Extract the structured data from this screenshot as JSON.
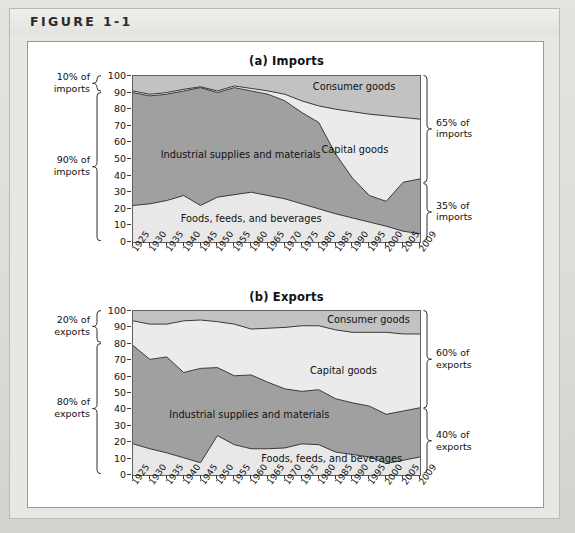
{
  "figure": {
    "label": "FIGURE 1-1"
  },
  "colors": {
    "foods": "#e8e8e8",
    "industrial": "#a0a0a0",
    "capital": "#ebebeb",
    "consumer": "#c2c2c2",
    "line": "#3a3a3a",
    "frame": "#5f5f5f",
    "page_bg": "#d9d9d6",
    "panel_bg": "#ffffff"
  },
  "panel_a": {
    "title": "(a) Imports",
    "left_braces": [
      {
        "line1": "10% of",
        "line2": "imports",
        "from": 90,
        "to": 100
      },
      {
        "line1": "90% of",
        "line2": "imports",
        "from": 0,
        "to": 90
      }
    ],
    "right_braces": [
      {
        "line1": "65% of",
        "line2": "imports",
        "from": 35,
        "to": 100
      },
      {
        "line1": "35% of",
        "line2": "imports",
        "from": 0,
        "to": 35
      }
    ],
    "area_labels": [
      {
        "text": "Industrial supplies and materials",
        "x": 0.1,
        "y": 52
      },
      {
        "text": "Foods, feeds, and beverages",
        "x": 0.17,
        "y": 13
      },
      {
        "text": "Consumer goods",
        "x": 0.63,
        "y": 93
      },
      {
        "text": "Capital goods",
        "x": 0.66,
        "y": 55
      }
    ]
  },
  "panel_b": {
    "title": "(b) Exports",
    "left_braces": [
      {
        "line1": "20% of",
        "line2": "exports",
        "from": 80,
        "to": 100
      },
      {
        "line1": "80% of",
        "line2": "exports",
        "from": 0,
        "to": 80
      }
    ],
    "right_braces": [
      {
        "line1": "60% of",
        "line2": "exports",
        "from": 40,
        "to": 100
      },
      {
        "line1": "40% of",
        "line2": "exports",
        "from": 0,
        "to": 40
      }
    ],
    "area_labels": [
      {
        "text": "Industrial supplies and materials",
        "x": 0.13,
        "y": 36
      },
      {
        "text": "Foods, feeds, and beverages",
        "x": 0.45,
        "y": 9
      },
      {
        "text": "Consumer goods",
        "x": 0.68,
        "y": 94
      },
      {
        "text": "Capital goods",
        "x": 0.62,
        "y": 63
      }
    ]
  },
  "axis": {
    "y_ticks": [
      0,
      10,
      20,
      30,
      40,
      50,
      60,
      70,
      80,
      90,
      100
    ],
    "y_min": 0,
    "y_max": 100,
    "x_labels": [
      "1925",
      "1930",
      "1935",
      "1940",
      "1945",
      "1950",
      "1955",
      "1960",
      "1965",
      "1970",
      "1975",
      "1980",
      "1985",
      "1990",
      "1995",
      "2000",
      "2005",
      "2009"
    ]
  },
  "chart_data": [
    {
      "type": "area",
      "title": "(a) Imports",
      "stacked": true,
      "percent": true,
      "xlabel": "",
      "ylabel": "",
      "ylim": [
        0,
        100
      ],
      "grid": false,
      "legend": "in-plot labels",
      "x": [
        "1925",
        "1930",
        "1935",
        "1940",
        "1945",
        "1950",
        "1955",
        "1960",
        "1965",
        "1970",
        "1975",
        "1980",
        "1985",
        "1990",
        "1995",
        "2000",
        "2005",
        "2009"
      ],
      "series": [
        {
          "name": "Foods, feeds, and beverages",
          "values": [
            22,
            23,
            25,
            28,
            22,
            27,
            28.5,
            30,
            28,
            26,
            23,
            20,
            17,
            14.5,
            12,
            9.5,
            6.5,
            5
          ]
        },
        {
          "name": "Industrial supplies and materials",
          "values": [
            68,
            65,
            64,
            63,
            71,
            63,
            64.5,
            61,
            61,
            59,
            55,
            52,
            36,
            24,
            16,
            15,
            29.5,
            33
          ]
        },
        {
          "name": "Capital goods",
          "values": [
            1,
            1,
            1,
            1,
            0.5,
            1,
            1,
            1.5,
            2,
            4,
            7,
            10,
            27,
            40,
            49,
            51.5,
            39,
            36
          ]
        },
        {
          "name": "Consumer goods",
          "values": [
            9,
            11,
            10,
            8,
            6.5,
            9,
            6,
            7.5,
            9,
            11,
            15,
            18,
            20,
            21.5,
            23,
            24,
            25,
            26
          ]
        }
      ],
      "cumulative_boundaries": {
        "foods_top": [
          22,
          23,
          25,
          28,
          22,
          27,
          28.5,
          30,
          28,
          26,
          23,
          20,
          17,
          14.5,
          12,
          9.5,
          6.5,
          5
        ],
        "industrial_top": [
          90,
          88,
          89,
          91,
          93,
          90,
          93,
          91,
          89,
          85,
          78,
          72,
          53,
          38.5,
          28,
          24.5,
          36,
          38
        ],
        "capital_top": [
          91,
          89,
          90,
          92,
          93.5,
          91,
          94,
          92.5,
          91,
          89,
          85,
          82,
          80,
          78.5,
          77,
          76,
          75,
          74
        ]
      }
    },
    {
      "type": "area",
      "title": "(b) Exports",
      "stacked": true,
      "percent": true,
      "xlabel": "",
      "ylabel": "",
      "ylim": [
        0,
        100
      ],
      "grid": false,
      "legend": "in-plot labels",
      "x": [
        "1925",
        "1930",
        "1935",
        "1940",
        "1945",
        "1950",
        "1955",
        "1960",
        "1965",
        "1970",
        "1975",
        "1980",
        "1985",
        "1990",
        "1995",
        "2000",
        "2005",
        "2009"
      ],
      "series": [
        {
          "name": "Foods, feeds, and beverages",
          "values": [
            19,
            16,
            13.5,
            10.5,
            7.5,
            24,
            18.5,
            16,
            16,
            16.5,
            19,
            18.5,
            14,
            12.5,
            11,
            7,
            9,
            11
          ]
        },
        {
          "name": "Industrial supplies and materials",
          "values": [
            60,
            54.5,
            58.5,
            52,
            57.5,
            41.5,
            42,
            45,
            40.5,
            36,
            32,
            33.5,
            32.5,
            31.5,
            31,
            30,
            30,
            30
          ]
        },
        {
          "name": "Capital goods",
          "values": [
            15,
            21.5,
            20,
            31.5,
            29.5,
            28,
            31.5,
            28,
            33,
            37.5,
            40,
            39,
            42,
            43,
            45,
            50,
            47,
            45
          ]
        },
        {
          "name": "Consumer goods",
          "values": [
            6,
            8,
            8,
            6,
            5.5,
            6.5,
            8,
            11,
            10.5,
            10,
            9,
            9,
            11.5,
            13,
            13,
            13,
            14,
            14
          ]
        }
      ],
      "cumulative_boundaries": {
        "foods_top": [
          19,
          16,
          13.5,
          10.5,
          7.5,
          24,
          18.5,
          16,
          16,
          16.5,
          19,
          18.5,
          14,
          12.5,
          11,
          7,
          9,
          11
        ],
        "industrial_top": [
          79,
          70.5,
          72,
          62.5,
          65,
          65.5,
          60.5,
          61,
          56.5,
          52.5,
          51,
          52,
          46.5,
          44,
          42,
          37,
          39,
          41
        ],
        "capital_top": [
          94,
          92,
          92,
          94,
          94.5,
          93.5,
          92,
          89,
          89.5,
          90,
          91,
          91,
          88.5,
          87,
          87,
          87,
          86,
          86
        ]
      }
    }
  ]
}
